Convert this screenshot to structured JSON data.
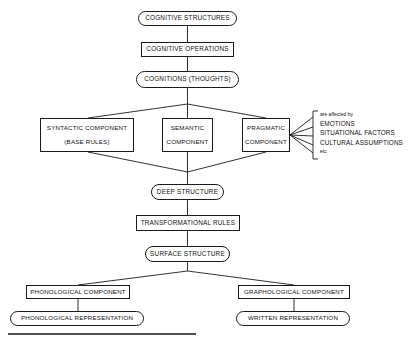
{
  "diagram": {
    "nodes": {
      "cognitive_structures": "COGNITIVE STRUCTURES",
      "cognitive_operations": "COGNITIVE OPERATIONS",
      "cognitions": "COGNITIONS (THOUGHTS)",
      "syntactic_component": "SYNTACTIC COMPONENT",
      "syntactic_subtitle": "(BASE RULES)",
      "semantic_component_line1": "SEMANTIC",
      "semantic_component_line2": "COMPONENT",
      "pragmatic_component_line1": "PRAGMATIC",
      "pragmatic_component_line2": "COMPONENT",
      "deep_structure": "DEEP STRUCTURE",
      "transformational_rules": "TRANSFORMATIONAL RULES",
      "surface_structure": "SURFACE STRUCTURE",
      "phonological_component": "PHONOLOGICAL COMPONENT",
      "graphological_component": "GRAPHOLOGICAL COMPONENT",
      "phonological_representation": "PHONOLOGICAL REPRESENTATION",
      "written_representation": "WRITTEN REPRESENTATION"
    },
    "annotation": {
      "intro": "are affected by",
      "item1": "EMOTIONS",
      "item2": "SITUATIONAL FACTORS",
      "item3": "CULTURAL ASSUMPTIONS",
      "item4": "etc"
    },
    "colors": {
      "stroke": "#1a1a1a",
      "text": "#111111",
      "background": "#ffffff"
    }
  }
}
